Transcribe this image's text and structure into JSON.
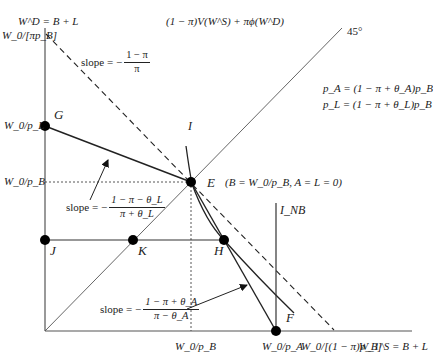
{
  "diagram": {
    "type": "economics-indifference-diagram",
    "axes": {
      "y_axis_label": "W^D = B + L",
      "x_axis_label": "W_1^S = B + L",
      "y_ticks": [
        "W_0/[πp_B]",
        "W_0/p_L",
        "W_0/p_B"
      ],
      "x_ticks": [
        "W_0/p_B",
        "W_0/p_A",
        "W_0/[(1 − π)p_B]"
      ]
    },
    "title_formula": "(1 − π)V(W^S) + πϕ(W^D)",
    "equations": {
      "pA": "p_A = (1 − π + θ_A)p_B",
      "pL": "p_L = (1 − π + θ_L)p_B"
    },
    "line_labels": {
      "diag": "45°",
      "indiff": "I",
      "indiff_nb": "I_NB"
    },
    "points": {
      "G": "G",
      "E": "E",
      "H": "H",
      "J": "J",
      "K": "K",
      "F": "F"
    },
    "point_E_note": "(B = W_0/p_B, A = L = 0)",
    "slopes": {
      "dashed": {
        "prefix": "slope = −",
        "num": "1 − π",
        "den": "π"
      },
      "GE": {
        "prefix": "slope = −",
        "num": "1 − π − θ_L",
        "den": "π + θ_L"
      },
      "EF": {
        "prefix": "slope = −",
        "num": "1 − π + θ_A",
        "den": "π − θ_A"
      }
    },
    "colors": {
      "line": "#222222",
      "thin": "#444444",
      "point": "#000000"
    }
  }
}
